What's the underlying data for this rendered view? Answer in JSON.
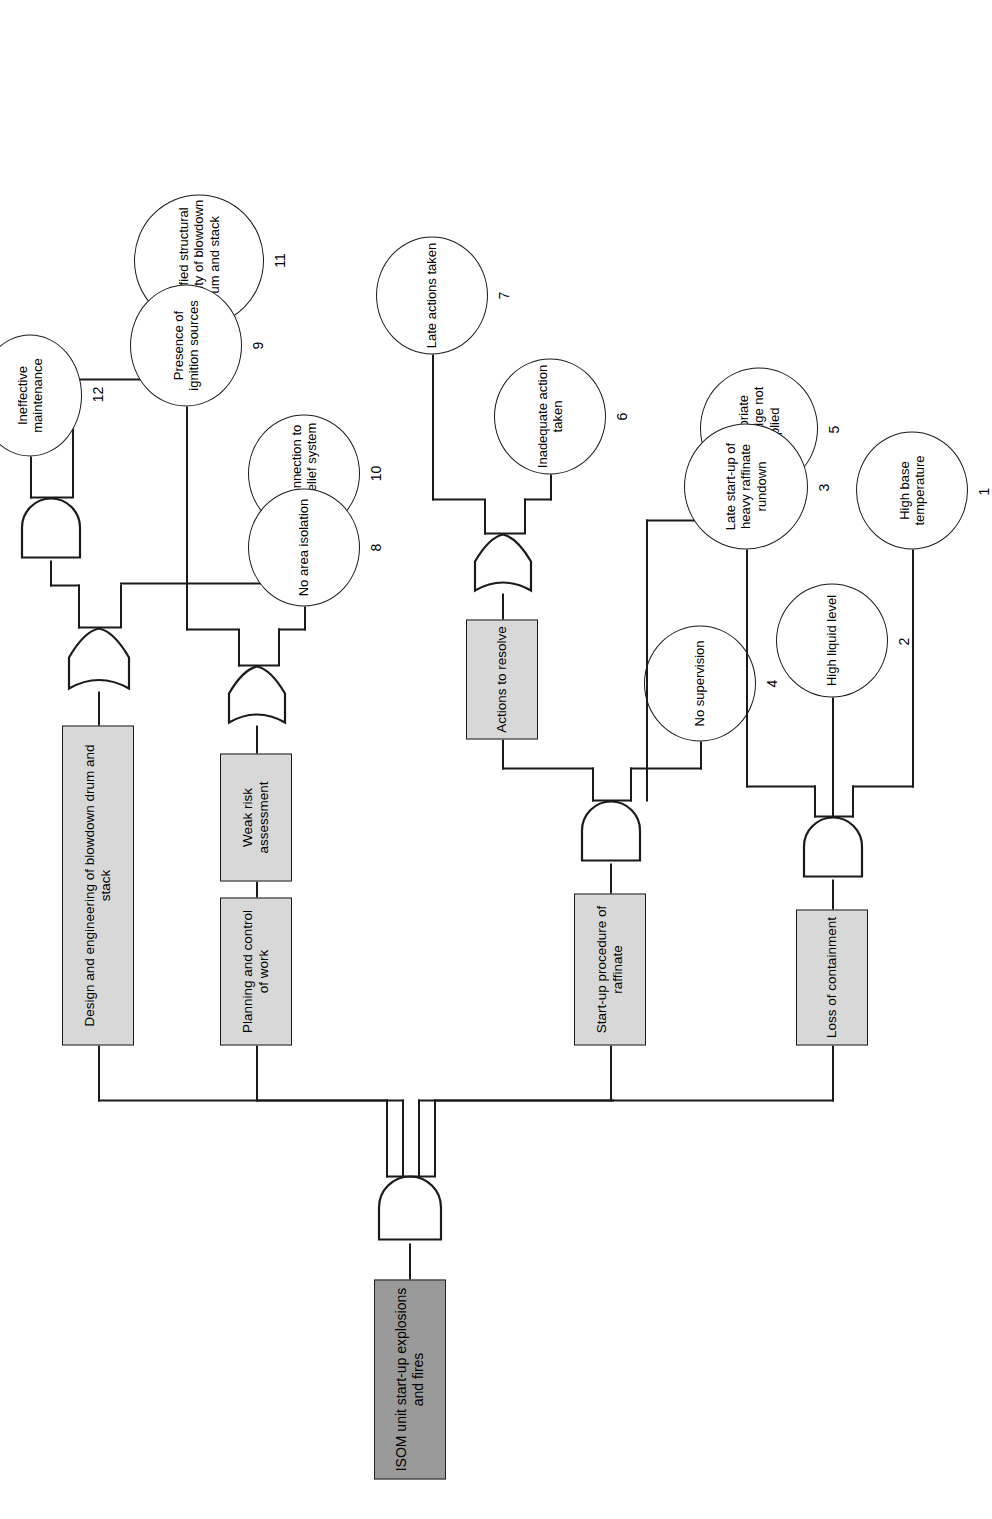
{
  "diagram": {
    "type": "fault-tree",
    "title_node": "ISOM unit start-up explosions and fires",
    "orientation": "rotated-90-ccw"
  },
  "nodes": {
    "top": {
      "label": "ISOM unit start-up explosions and fires",
      "shape": "rect",
      "fill": "#9a9a9a"
    },
    "b1": {
      "label": "Loss of containment",
      "shape": "rect",
      "fill": "#d8d8d8"
    },
    "b2": {
      "label": "Start-up procedure of raffinate",
      "shape": "rect",
      "fill": "#d8d8d8"
    },
    "b2a": {
      "label": "Actions to resolve",
      "shape": "rect",
      "fill": "#d8d8d8"
    },
    "b3": {
      "label": "Planning and control of work",
      "shape": "rect",
      "fill": "#d8d8d8"
    },
    "b3a": {
      "label": "Weak risk assessment",
      "shape": "rect",
      "fill": "#d8d8d8"
    },
    "b4": {
      "label": "Design and engineering of blowdown drum and stack",
      "shape": "rect",
      "fill": "#d8d8d8"
    }
  },
  "basic_events": [
    {
      "id": "e1",
      "number": "1",
      "label": "High base temperature"
    },
    {
      "id": "e2",
      "number": "2",
      "label": "High liquid level"
    },
    {
      "id": "e3",
      "number": "3",
      "label": "Late start-up of heavy raffinate rundown"
    },
    {
      "id": "e4",
      "number": "4",
      "label": "No supervision"
    },
    {
      "id": "e5",
      "number": "5",
      "label": "Appropriate knowledge not applied"
    },
    {
      "id": "e6",
      "number": "6",
      "label": "Inadequate action taken"
    },
    {
      "id": "e7",
      "number": "7",
      "label": "Late actions taken"
    },
    {
      "id": "e8",
      "number": "8",
      "label": "No area isolation"
    },
    {
      "id": "e9",
      "number": "9",
      "label": "Presence of ignition sources"
    },
    {
      "id": "e10",
      "number": "10",
      "label": "No connection to flare relief system"
    },
    {
      "id": "e11",
      "number": "11",
      "label": "Modified structural integrity of blowdown drum and stack"
    },
    {
      "id": "e12",
      "number": "12",
      "label": "Ineffective maintenance"
    }
  ],
  "gates": [
    {
      "id": "g-top",
      "type": "AND",
      "parent": "top"
    },
    {
      "id": "g-b1",
      "type": "AND",
      "parent": "b1"
    },
    {
      "id": "g-b2",
      "type": "AND",
      "parent": "b2"
    },
    {
      "id": "g-b2a",
      "type": "OR",
      "parent": "b2a"
    },
    {
      "id": "g-b3a",
      "type": "OR",
      "parent": "b3a"
    },
    {
      "id": "g-b4",
      "type": "OR",
      "parent": "b4"
    },
    {
      "id": "g-b4b",
      "type": "AND",
      "parent": "b4-sub"
    }
  ],
  "colors": {
    "line": "#1a1a1a",
    "box_fill": "#d8d8d8",
    "top_fill": "#9a9a9a",
    "page_bg": "#ffffff"
  }
}
